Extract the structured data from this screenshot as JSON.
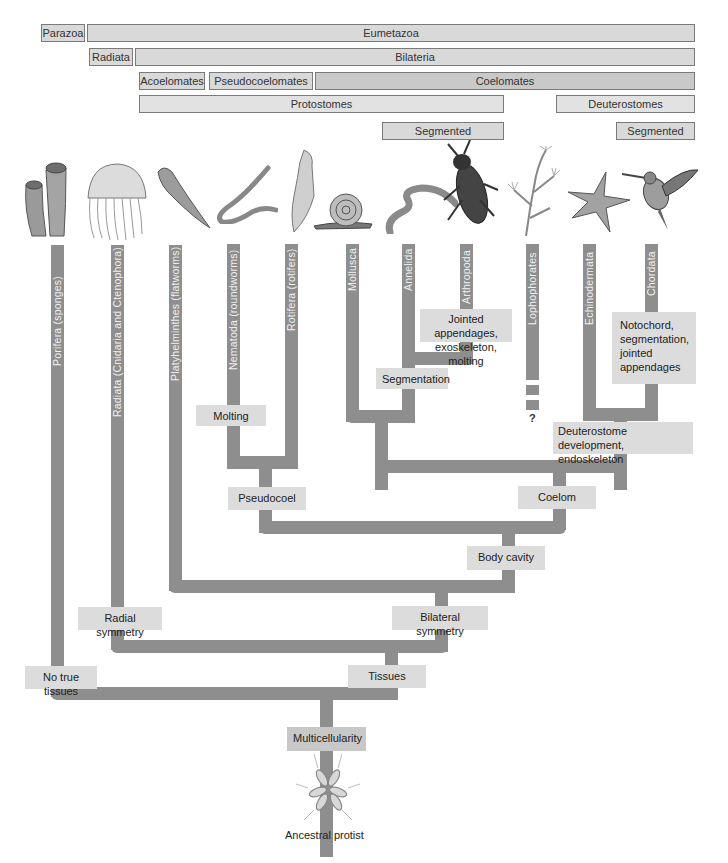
{
  "header_bars": {
    "row1": [
      {
        "label": "Parazoa"
      },
      {
        "label": "Eumetazoa"
      }
    ],
    "row2": [
      {
        "label": "Radiata"
      },
      {
        "label": "Bilateria"
      }
    ],
    "row3": [
      {
        "label": "Acoelomates"
      },
      {
        "label": "Pseudocoelomates"
      },
      {
        "label": "Coelomates"
      }
    ],
    "row4": [
      {
        "label": "Protostomes"
      },
      {
        "label": "Deuterostomes"
      }
    ],
    "row5": [
      {
        "label": "Segmented"
      },
      {
        "label": "Segmented"
      }
    ]
  },
  "taxa": [
    {
      "label": "Porifera (sponges)",
      "animal": "sponge-icon"
    },
    {
      "label": "Radiata (Cnidaria and Ctenophora)",
      "animal": "jellyfish-icon"
    },
    {
      "label": "Platyhelminthes (flatworms)",
      "animal": "flatworm-icon"
    },
    {
      "label": "Nematoda (roundworms)",
      "animal": "roundworm-icon"
    },
    {
      "label": "Rotifera (rotifers)",
      "animal": "rotifer-icon"
    },
    {
      "label": "Mollusca",
      "animal": "snail-icon"
    },
    {
      "label": "Annelida",
      "animal": "earthworm-icon"
    },
    {
      "label": "Arthropoda",
      "animal": "beetle-icon"
    },
    {
      "label": "Lophophorates",
      "animal": "bryozoan-icon"
    },
    {
      "label": "Echinodermata",
      "animal": "starfish-icon"
    },
    {
      "label": "Chordata",
      "animal": "hummingbird-icon"
    }
  ],
  "traits": {
    "jointed_appendages": "Jointed appendages, exoskeleton, molting",
    "notochord": "Notochord, segmentation, jointed appendages",
    "segmentation": "Segmentation",
    "molting": "Molting",
    "deuterostome_dev": "Deuterostome development, endoskeleton",
    "pseudocoel": "Pseudocoel",
    "coelom": "Coelom",
    "body_cavity": "Body cavity",
    "radial_symmetry": "Radial symmetry",
    "bilateral_symmetry": "Bilateral symmetry",
    "no_true_tissues": "No true tissues",
    "tissues": "Tissues",
    "multicellularity": "Multicellularity"
  },
  "unknown_marker": "?",
  "root": {
    "label": "Ancestral protist",
    "icon": "choanoflagellate-colony-icon"
  },
  "colors": {
    "branch": "#8e8e8e",
    "trait_box": "#dcdcdc",
    "header_bar": "#d9d9d9",
    "header_border": "#7a7a7a"
  }
}
